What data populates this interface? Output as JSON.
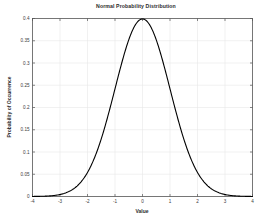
{
  "chart_data": {
    "type": "line",
    "title": "Normal Probability Distribution",
    "xlabel": "Value",
    "ylabel": "Probability of Occurrence",
    "xlim": [
      -4,
      4
    ],
    "ylim": [
      0,
      0.4
    ],
    "grid": true,
    "legend": "none",
    "line_color": "#000000",
    "line_width": 1.1,
    "background_color": "#ffffff",
    "grid_color": "#e8e8e8",
    "axis_color": "#555555",
    "xticks": [
      -4,
      -3,
      -2,
      -1,
      0,
      1,
      2,
      3,
      4
    ],
    "xtick_labels": [
      "-4",
      "-3",
      "-2",
      "-1",
      "0",
      "1",
      "2",
      "3",
      "4"
    ],
    "yticks": [
      0,
      0.05,
      0.1,
      0.15,
      0.2,
      0.25,
      0.3,
      0.35,
      0.4
    ],
    "ytick_labels": [
      "0",
      "0.05",
      "0.1",
      "0.15",
      "0.2",
      "0.25",
      "0.3",
      "0.35",
      "0.4"
    ],
    "series": [
      {
        "name": "Normal PDF (mean 0, sd 1)",
        "x": [
          -4,
          -3.8,
          -3.6,
          -3.4,
          -3.2,
          -3,
          -2.8,
          -2.6,
          -2.4,
          -2.2,
          -2,
          -1.8,
          -1.6,
          -1.4,
          -1.2,
          -1,
          -0.8,
          -0.6,
          -0.4,
          -0.2,
          0,
          0.2,
          0.4,
          0.6,
          0.8,
          1,
          1.2,
          1.4,
          1.6,
          1.8,
          2,
          2.2,
          2.4,
          2.6,
          2.8,
          3,
          3.2,
          3.4,
          3.6,
          3.8,
          4
        ],
        "values": [
          0.0001,
          0.0003,
          0.0006,
          0.0012,
          0.0024,
          0.0044,
          0.0079,
          0.0136,
          0.0224,
          0.0355,
          0.054,
          0.079,
          0.1109,
          0.1497,
          0.1942,
          0.242,
          0.2897,
          0.3332,
          0.3683,
          0.391,
          0.3989,
          0.391,
          0.3683,
          0.3332,
          0.2897,
          0.242,
          0.1942,
          0.1497,
          0.1109,
          0.079,
          0.054,
          0.0355,
          0.0224,
          0.0136,
          0.0079,
          0.0044,
          0.0024,
          0.0012,
          0.0006,
          0.0003,
          0.0001
        ]
      }
    ],
    "peak": {
      "x": 0,
      "y": 0.3989
    }
  }
}
